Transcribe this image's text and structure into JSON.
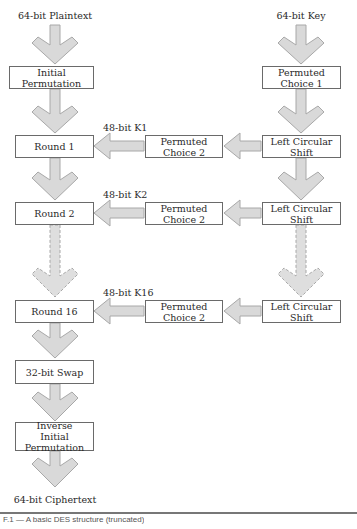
{
  "diagram": {
    "inputs": {
      "plaintext": "64-bit Plaintext",
      "key": "64-bit Key"
    },
    "output": "64-bit Ciphertext",
    "left_column": {
      "initial_permutation": "Initial Permutation",
      "rounds": [
        "Round 1",
        "Round 2",
        "Round 16"
      ],
      "swap": "32-bit Swap",
      "inverse_permutation": "Inverse Initial Permutation"
    },
    "right_column": {
      "permuted_choice_1": "Permuted Choice 1",
      "shifts": [
        "Left Circular Shift",
        "Left Circular Shift",
        "Left Circular Shift"
      ]
    },
    "middle_column": {
      "permuted_choice_2": [
        "Permuted Choice 2",
        "Permuted Choice 2",
        "Permuted Choice 2"
      ]
    },
    "subkeys": [
      "48-bit K1",
      "48-bit K2",
      "48-bit K16"
    ],
    "colors": {
      "arrow_fill": "#d9d9d9",
      "arrow_stroke": "#a8a8a8",
      "box_border": "#6a6a6a",
      "text": "#2a2a2a"
    }
  },
  "caption": {
    "text": "F.1 — A basic DES structure (truncated)"
  }
}
